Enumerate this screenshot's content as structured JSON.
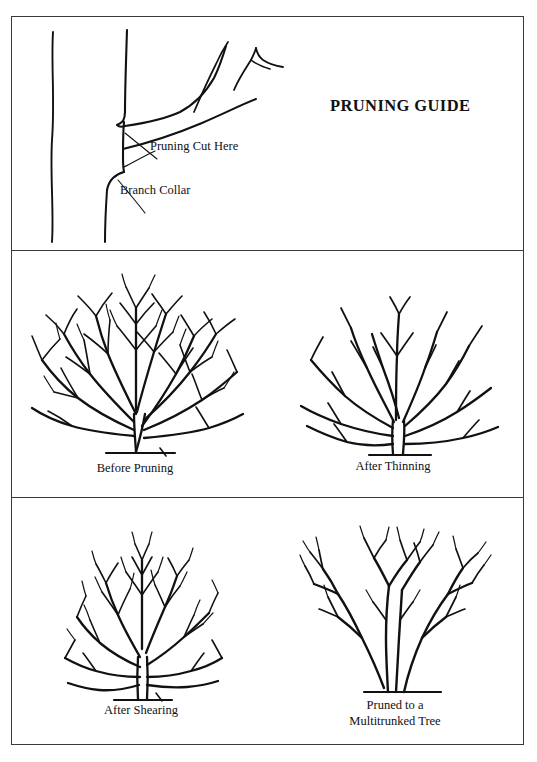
{
  "document": {
    "title": "PRUNING GUIDE",
    "type": "instructional-diagram",
    "background_color": "#ffffff",
    "ink_color": "#111111",
    "frame_color": "#3a3a3a"
  },
  "panels": [
    {
      "id": "panel-top",
      "name": "branch-collar-detail",
      "title": "PRUNING GUIDE",
      "figure": "tree trunk with a lateral branch showing the branch collar and the correct cut location",
      "callouts": [
        {
          "id": "pruning-cut",
          "label": "Pruning Cut Here"
        },
        {
          "id": "branch-collar",
          "label": "Branch Collar"
        }
      ]
    },
    {
      "id": "panel-middle",
      "name": "thinning-comparison",
      "figures": [
        {
          "id": "before-pruning",
          "caption": "Before Pruning",
          "description": "dense multi-stemmed deciduous shrub with many crossing twigs"
        },
        {
          "id": "after-thinning",
          "caption": "After Thinning",
          "description": "same shrub with interior branches removed, open vase habit"
        }
      ]
    },
    {
      "id": "panel-bottom",
      "name": "shearing-and-tree-form",
      "figures": [
        {
          "id": "after-shearing",
          "caption": "After Shearing",
          "description": "shrub sheared into a dense rounded ball with twiggy outer shell"
        },
        {
          "id": "multitrunked-tree",
          "caption_lines": [
            "Pruned to a",
            "Multitrunked Tree"
          ],
          "description": "shrub limbed up into a small tree with several clean trunks"
        }
      ]
    }
  ],
  "captions": {
    "before_pruning": "Before Pruning",
    "after_thinning": "After Thinning",
    "after_shearing": "After Shearing",
    "multitrunk_line1": "Pruned to a",
    "multitrunk_line2": "Multitrunked Tree"
  },
  "callouts": {
    "pruning_cut": "Pruning Cut Here",
    "branch_collar": "Branch Collar"
  }
}
